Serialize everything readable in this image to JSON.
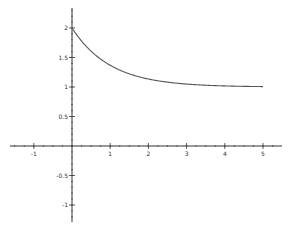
{
  "chart_data": {
    "type": "line",
    "title": "",
    "xlabel": "",
    "ylabel": "",
    "function": "y = 1 + e^(-x)",
    "x": [
      0,
      0.25,
      0.5,
      0.75,
      1,
      1.5,
      2,
      2.5,
      3,
      3.5,
      4,
      4.5,
      5
    ],
    "series": [
      {
        "name": "f(x)",
        "values": [
          2.0,
          1.779,
          1.607,
          1.472,
          1.368,
          1.223,
          1.135,
          1.082,
          1.05,
          1.03,
          1.018,
          1.011,
          1.007
        ],
        "color": "#555555"
      }
    ],
    "xlim": [
      -1.6,
      5.5
    ],
    "ylim": [
      -1.3,
      2.3
    ],
    "x_ticks": [
      "-1",
      "1",
      "2",
      "3",
      "4",
      "5"
    ],
    "y_ticks": [
      "2",
      "1.5",
      "1",
      "0.5",
      "-0.5",
      "-1"
    ],
    "grid": false,
    "legend": "none",
    "axes_style": "centered at origin"
  },
  "layout": {
    "origin_px": [
      72,
      146
    ],
    "px_per_x": 38.2,
    "px_per_y": 59,
    "axis_color": "#333333",
    "curve_color": "#555555"
  }
}
